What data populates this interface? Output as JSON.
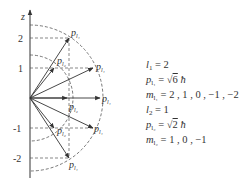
{
  "diagram": {
    "axis_label": "z",
    "ticks": [
      "2",
      "1",
      "-1",
      "-2"
    ],
    "vector_label": "p",
    "vector_sub_l1": "l₁",
    "vector_sub_l2": "l₂"
  },
  "equations": [
    {
      "var": "l",
      "sub": "1",
      "rhs": "= 2"
    },
    {
      "var": "p",
      "sub": "l₁",
      "rhs_prefix": "= √",
      "radicand": "6",
      "rhs_suffix": " ħ"
    },
    {
      "var": "m",
      "sub": "l₁",
      "rhs": "= 2 , 1 , 0 , −1 , −2"
    },
    {
      "var": "l",
      "sub": "2",
      "rhs": "= 1"
    },
    {
      "var": "p",
      "sub": "l₂",
      "rhs_prefix": "= √",
      "radicand": "2",
      "rhs_suffix": " ħ"
    },
    {
      "var": "m",
      "sub": "l₂",
      "rhs": "= 1 , 0 , −1"
    }
  ]
}
